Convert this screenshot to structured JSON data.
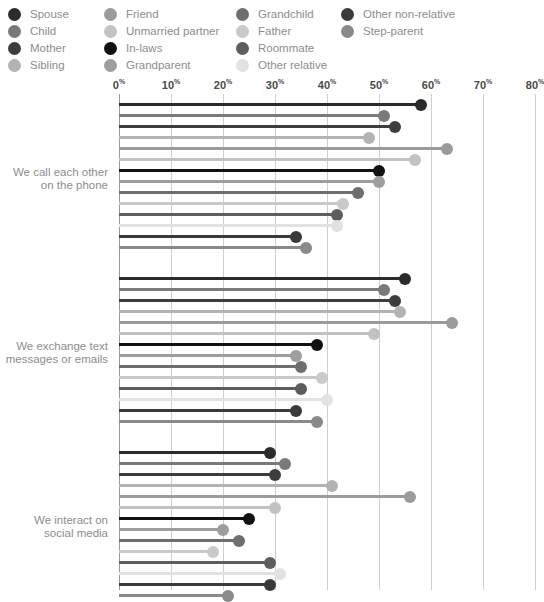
{
  "legend": {
    "columns": [
      [
        {
          "label": "Spouse",
          "color": "#2b2b2b"
        },
        {
          "label": "Child",
          "color": "#7a7a7a"
        },
        {
          "label": "Mother",
          "color": "#3d3d3d"
        },
        {
          "label": "Sibling",
          "color": "#b3b3b3"
        }
      ],
      [
        {
          "label": "Friend",
          "color": "#9b9b9b"
        },
        {
          "label": "Unmarried partner",
          "color": "#c2c2c2"
        },
        {
          "label": "In-laws",
          "color": "#111111"
        },
        {
          "label": "Grandparent",
          "color": "#9e9e9e"
        }
      ],
      [
        {
          "label": "Grandchild",
          "color": "#6e6e6e"
        },
        {
          "label": "Father",
          "color": "#c9c9c9"
        },
        {
          "label": "Roommate",
          "color": "#5d5d5d"
        },
        {
          "label": "Other relative",
          "color": "#e2e2e2"
        }
      ],
      [
        {
          "label": "Other non-relative",
          "color": "#3a3a3a"
        },
        {
          "label": "Step-parent",
          "color": "#8a8a8a"
        }
      ]
    ]
  },
  "chart_data": {
    "type": "bar",
    "orientation": "horizontal",
    "style": "lollipop",
    "title": "",
    "xlabel": "",
    "ylabel": "",
    "xlim": [
      0,
      80
    ],
    "grid": true,
    "legend_position": "top",
    "tick_labels": [
      "0%",
      "10%",
      "20%",
      "30%",
      "40%",
      "50%",
      "60%",
      "70%",
      "80%"
    ],
    "ticks": [
      0,
      10,
      20,
      30,
      40,
      50,
      60,
      70,
      80
    ],
    "categories": [
      "Spouse",
      "Child",
      "Mother",
      "Sibling",
      "Friend",
      "Unmarried partner",
      "In-laws",
      "Grandparent",
      "Grandchild",
      "Father",
      "Roommate",
      "Other relative",
      "Other non-relative",
      "Step-parent"
    ],
    "category_colors": [
      "#2b2b2b",
      "#7a7a7a",
      "#3d3d3d",
      "#b3b3b3",
      "#9b9b9b",
      "#c2c2c2",
      "#111111",
      "#9e9e9e",
      "#6e6e6e",
      "#c9c9c9",
      "#5d5d5d",
      "#e2e2e2",
      "#3a3a3a",
      "#8a8a8a"
    ],
    "groups": [
      {
        "label_line1": "We call each other",
        "label_line2": "on the phone",
        "values": [
          58,
          51,
          53,
          48,
          63,
          57,
          50,
          50,
          46,
          43,
          42,
          42,
          34,
          36
        ]
      },
      {
        "label_line1": "We exchange text",
        "label_line2": "messages or emails",
        "values": [
          55,
          51,
          53,
          54,
          64,
          49,
          38,
          34,
          35,
          39,
          35,
          40,
          34,
          38
        ]
      },
      {
        "label_line1": "We interact on",
        "label_line2": "social media",
        "values": [
          29,
          32,
          30,
          41,
          56,
          30,
          25,
          20,
          23,
          18,
          29,
          31,
          29,
          21
        ]
      }
    ]
  }
}
